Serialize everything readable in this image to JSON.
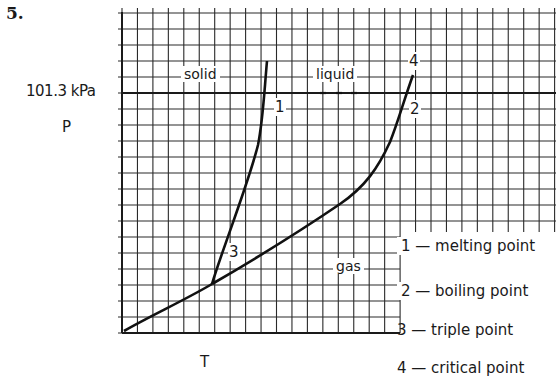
{
  "question_number": "5.",
  "axes": {
    "pressure_reference": "101.3 kPa",
    "y_label": "P",
    "x_label": "T"
  },
  "regions": {
    "solid": "solid",
    "liquid": "liquid",
    "gas": "gas"
  },
  "point_labels": {
    "melting": "1",
    "boiling": "2",
    "triple": "3",
    "critical": "4"
  },
  "legend": [
    {
      "number": "1",
      "dash": "—",
      "text": "melting point"
    },
    {
      "number": "2",
      "dash": "—",
      "text": "boiling point"
    },
    {
      "number": "3",
      "dash": "—",
      "text": "triple point"
    },
    {
      "number": "4",
      "dash": "—",
      "text": "critical point"
    }
  ],
  "legend_lines": [
    "1 — melting point",
    "2 — boiling point",
    "3 — triple point",
    "4 — critical point"
  ],
  "colors": {
    "ink": "#1a1a1a",
    "grid": "#2a2a2a",
    "background": "#ffffff"
  }
}
